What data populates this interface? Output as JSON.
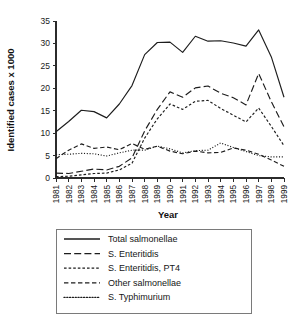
{
  "chart_data": {
    "type": "line",
    "title": "",
    "xlabel": "Year",
    "ylabel": "Identified cases x 1000",
    "xlim": [
      1981,
      1999
    ],
    "ylim": [
      0,
      35
    ],
    "yticks": [
      0,
      5,
      10,
      15,
      20,
      25,
      30,
      35
    ],
    "grid": false,
    "legend_position": "below",
    "x": [
      1981,
      1982,
      1983,
      1984,
      1985,
      1986,
      1987,
      1988,
      1989,
      1990,
      1991,
      1992,
      1993,
      1994,
      1995,
      1996,
      1997,
      1998,
      1999
    ],
    "categories": [
      "1981",
      "1982",
      "1983",
      "1984",
      "1985",
      "1986",
      "1987",
      "1988",
      "1989",
      "1990",
      "1991",
      "1992",
      "1993",
      "1994",
      "1995",
      "1996",
      "1997",
      "1998",
      "1999"
    ],
    "series": [
      {
        "name": "Total salmonellae",
        "style": "solid",
        "values": [
          10.3,
          12.6,
          15.1,
          14.8,
          13.4,
          16.5,
          20.6,
          27.5,
          30.2,
          30.3,
          28.0,
          31.6,
          30.5,
          30.6,
          30.1,
          29.4,
          33.0,
          27.0,
          18.0
        ]
      },
      {
        "name": "S. Enteritidis",
        "style": "long-dash",
        "values": [
          1.1,
          1.0,
          1.5,
          2.0,
          1.8,
          2.6,
          4.5,
          10.5,
          15.3,
          19.2,
          18.0,
          20.1,
          20.5,
          18.9,
          17.9,
          16.3,
          23.3,
          17.0,
          11.4
        ]
      },
      {
        "name": "S. Enteritidis, PT4",
        "style": "short-dash",
        "values": [
          0.3,
          0.4,
          0.7,
          1.0,
          1.1,
          1.8,
          3.3,
          8.9,
          13.2,
          16.5,
          15.3,
          17.1,
          17.3,
          15.5,
          14.0,
          12.5,
          15.6,
          11.5,
          7.2
        ]
      },
      {
        "name": "Other salmonellae",
        "style": "medium-dash",
        "values": [
          4.3,
          6.2,
          7.6,
          6.6,
          6.9,
          6.3,
          7.7,
          6.4,
          7.1,
          6.0,
          5.4,
          6.0,
          5.6,
          5.7,
          6.7,
          6.2,
          5.3,
          4.0,
          2.6
        ]
      },
      {
        "name": "S. Typhimurium",
        "style": "dotted",
        "values": [
          5.2,
          5.3,
          5.5,
          5.4,
          4.9,
          5.6,
          6.2,
          6.2,
          7.1,
          6.5,
          5.6,
          6.1,
          6.2,
          7.8,
          6.8,
          5.9,
          5.0,
          4.7,
          4.7
        ]
      }
    ],
    "legend": [
      {
        "label": "Total salmonellae",
        "style": "solid"
      },
      {
        "label": "S. Enteritidis",
        "style": "long-dash"
      },
      {
        "label": "S. Enteritidis, PT4",
        "style": "short-dash"
      },
      {
        "label": "Other salmonellae",
        "style": "medium-dash"
      },
      {
        "label": "S. Typhimurium",
        "style": "dotted"
      }
    ]
  }
}
